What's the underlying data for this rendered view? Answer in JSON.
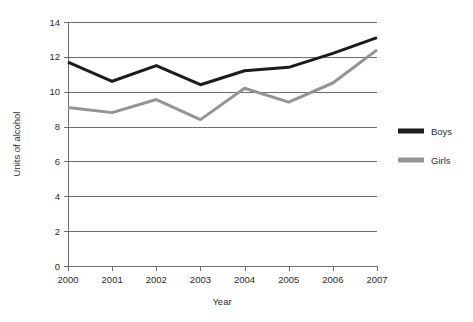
{
  "chart_data": {
    "type": "line",
    "title": "",
    "xlabel": "Year",
    "ylabel": "Units of alcohol",
    "categories": [
      "2000",
      "2001",
      "2002",
      "2003",
      "2004",
      "2005",
      "2006",
      "2007"
    ],
    "x": [
      2000,
      2001,
      2002,
      2003,
      2004,
      2005,
      2006,
      2007
    ],
    "xlim": [
      2000,
      2007
    ],
    "ylim": [
      0,
      14
    ],
    "yticks": [
      0,
      2,
      4,
      6,
      8,
      10,
      12,
      14
    ],
    "ytick_labels": [
      "0",
      "2",
      "4",
      "6",
      "8",
      "10",
      "12",
      "14"
    ],
    "xticks": [
      2000,
      2001,
      2002,
      2003,
      2004,
      2005,
      2006,
      2007
    ],
    "xtick_labels": [
      "2000",
      "2001",
      "2002",
      "2003",
      "2004",
      "2005",
      "2006",
      "2007"
    ],
    "grid": "horizontal",
    "legend_position": "right",
    "series": [
      {
        "name": "Boys",
        "color": "#1c1c1c",
        "line_width": 3,
        "values": [
          11.7,
          10.6,
          11.5,
          10.4,
          11.2,
          11.4,
          12.2,
          13.1
        ]
      },
      {
        "name": "Girls",
        "color": "#949494",
        "line_width": 3,
        "values": [
          9.1,
          8.8,
          9.55,
          8.4,
          10.2,
          9.4,
          10.5,
          12.4
        ]
      }
    ]
  },
  "legend": {
    "entries": [
      {
        "label": "Boys",
        "color": "#1c1c1c"
      },
      {
        "label": "Girls",
        "color": "#949494"
      }
    ]
  },
  "axes": {
    "x_title": "Year",
    "y_title": "Units of alcohol"
  }
}
